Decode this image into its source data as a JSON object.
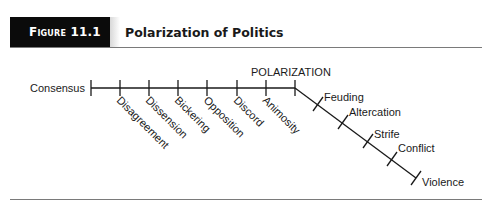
{
  "figure": {
    "label": "Figure 11.1",
    "title": "Polarization of Politics"
  },
  "diagram": {
    "start_label": "Consensus",
    "pivot_label": "POLARIZATION",
    "horizontal_stages": [
      "Disagreement",
      "Dissension",
      "Bickering",
      "Opposition",
      "Discord",
      "Animosity"
    ],
    "diagonal_stages": [
      "Feuding",
      "Altercation",
      "Strife",
      "Conflict",
      "Violence"
    ],
    "colors": {
      "line": "#1a1a1a",
      "badge_background": "#0b0b0b",
      "badge_text": "#ffffff",
      "rule": "#7a7a7a"
    }
  }
}
